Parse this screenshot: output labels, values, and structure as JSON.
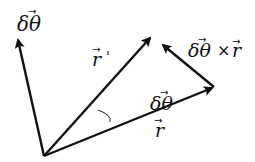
{
  "diagram": {
    "type": "vector-rotation",
    "origin": {
      "x": 44,
      "y": 156
    },
    "stroke_color": "#111111",
    "background": "#ffffff",
    "vectors": [
      {
        "id": "dtheta",
        "label": "δθ",
        "vec_marker": "→",
        "from": [
          44,
          156
        ],
        "to": [
          17,
          37
        ]
      },
      {
        "id": "r_prime",
        "label": "r",
        "suffix": "'",
        "vec_marker": "→",
        "from": [
          44,
          156
        ],
        "to": [
          152,
          36
        ]
      },
      {
        "id": "r",
        "label": "r",
        "vec_marker": "→",
        "from": [
          44,
          156
        ],
        "to": [
          214,
          87
        ]
      },
      {
        "id": "dtheta_cross_r",
        "label": "δθ × r",
        "vec_marker": "→",
        "from": [
          214,
          87
        ],
        "to": [
          161,
          43
        ]
      }
    ],
    "angle_label": "δθ",
    "labels": {
      "top_left": "δθ",
      "r_prime": "r",
      "r_prime_suffix": "'",
      "cross": "δθ",
      "cross_times": "×",
      "cross_r": "r",
      "angle": "δθ",
      "r": "r",
      "arrow": "→"
    }
  }
}
